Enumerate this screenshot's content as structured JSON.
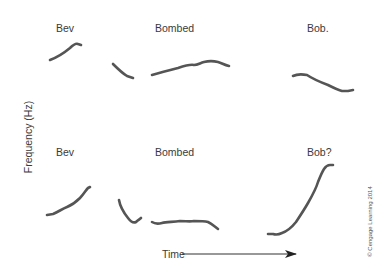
{
  "figure": {
    "type": "intonation-pitch-contour-diagram",
    "y_axis_label": "Frequency (Hz)",
    "x_axis_label": "Time",
    "copyright": "© Cengage Learning 2014",
    "colors": {
      "contour": "#555555",
      "text": "#3a3a3a",
      "background": "#ffffff"
    }
  },
  "rows": [
    {
      "name": "statement",
      "words": [
        {
          "label": "Bev"
        },
        {
          "label": "Bombed"
        },
        {
          "label": "Bob."
        }
      ],
      "contours": {
        "bev": "M50,60 C58,57 64,53 70,48 C73,45 76,43 78,44 L81,45",
        "bombed_onset": "M113,64 C118,69 122,73 127,76 L133,78",
        "bombed_vowel": "M152,75 C162,72 170,70 178,68 C184,66 190,64 194,65 C198,65 200,63 204,62 C208,61 214,61 218,62 C222,63 224,65 229,66",
        "bob": "M293,76 C297,74 302,74 307,75 C313,79 320,82 328,85 C334,88 338,90 342,91 L348,91 L353,90"
      }
    },
    {
      "name": "question",
      "words": [
        {
          "label": "Bev"
        },
        {
          "label": "Bombed"
        },
        {
          "label": "Bob?"
        }
      ],
      "contours": {
        "bev": "M47,215 L53,214 C58,212 62,209 67,207 C72,205 76,202 80,198 C84,194 86,190 88,188 L90,187",
        "bombed_onset": "M119,200 C120,206 124,213 128,218 C131,222 134,223 136,222 C138,220 140,219 141,218",
        "bombed_vowel": "M152,222 C155,224 158,224 162,223 C166,222 172,222 180,221 C186,221 190,222 194,221 C200,221 204,221 208,222 C212,224 214,226 218,229",
        "bob": "M268,234 L273,234 C276,235 278,235 282,233 C288,231 292,227 296,222 C300,216 304,210 308,203 C312,196 316,189 318,182 C320,177 322,172 324,169 C326,166 327,165 330,165 L333,165"
      }
    }
  ],
  "time_arrow": {
    "x1": 182,
    "y1": 254,
    "x2": 296,
    "y2": 254
  }
}
